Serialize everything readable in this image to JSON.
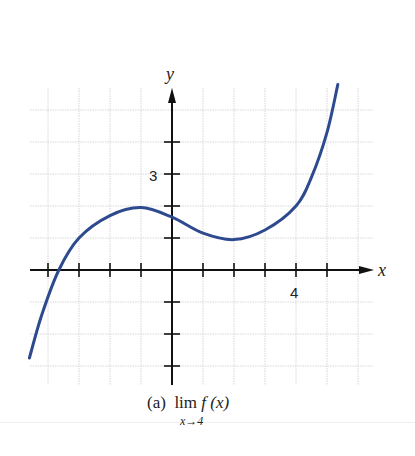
{
  "chart_data": {
    "type": "line",
    "title": "",
    "caption": "(a) lim f(x), x→4",
    "xlabel": "x",
    "ylabel": "y",
    "xlim": [
      -4.6,
      6.5
    ],
    "ylim": [
      -3.5,
      5.9
    ],
    "grid": true,
    "x_tick_labels": [
      {
        "value": 4,
        "label": "4"
      }
    ],
    "y_tick_labels": [
      {
        "value": 3,
        "label": "3"
      }
    ],
    "x_ticks": [
      -4,
      -3,
      -2,
      -1,
      1,
      2,
      3,
      4,
      5
    ],
    "y_ticks": [
      -3,
      -2,
      -1,
      1,
      2,
      3,
      4
    ],
    "series": [
      {
        "name": "f(x)",
        "color": "#2e4a8f",
        "x": [
          -4.6,
          -4.2,
          -3.65,
          -3.0,
          -2.0,
          -1.0,
          0.0,
          1.0,
          2.0,
          3.0,
          4.0,
          4.5,
          5.0,
          5.35
        ],
        "y": [
          -2.75,
          -1.4,
          0.0,
          1.0,
          1.7,
          1.95,
          1.65,
          1.15,
          0.95,
          1.25,
          2.0,
          2.9,
          4.3,
          5.8
        ]
      }
    ]
  },
  "labels": {
    "x_axis": "x",
    "y_axis": "y",
    "tick_x_4": "4",
    "tick_y_3": "3",
    "caption_part": "(a)",
    "caption_lim": "lim",
    "caption_func": "f (x)",
    "caption_sub": "x→4"
  },
  "colors": {
    "curve": "#2e4a8f",
    "axis": "#111111",
    "grid": "#d6d6d6"
  }
}
